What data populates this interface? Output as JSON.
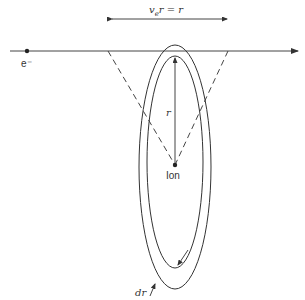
{
  "diagram": {
    "top_label": {
      "v": "v",
      "sub": "e",
      "rest": "r  =  r"
    },
    "electron_label": "e⁻",
    "radius_label": "r",
    "ion_label": "Ion",
    "shell_label": "dr",
    "line_color": "#333333"
  }
}
